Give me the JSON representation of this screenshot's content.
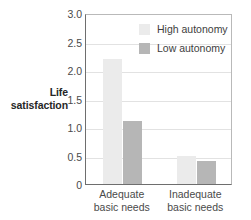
{
  "chart_data": {
    "type": "bar",
    "title": "",
    "xlabel": "",
    "ylabel": "Life satisfaction",
    "categories": [
      "Adequate basic needs",
      "Inadequate basic needs"
    ],
    "series": [
      {
        "name": "High autonomy",
        "color": "#ebebeb",
        "values": [
          2.2,
          0.5
        ]
      },
      {
        "name": "Low autonomy",
        "color": "#b6b6b6",
        "values": [
          1.1,
          0.4
        ]
      }
    ],
    "ylim": [
      0,
      3.0
    ],
    "yticks": [
      0,
      0.5,
      1.0,
      1.5,
      2.0,
      2.5,
      3.0
    ],
    "ytick_labels": [
      "0",
      "0.5",
      "1.0",
      "1.5",
      "2.0",
      "2.5",
      "3.0"
    ],
    "grid": true,
    "legend_position": "top-right"
  },
  "axis": {
    "y_title_lines": [
      "Life",
      "satisfaction"
    ],
    "tick_labels": {
      "y": [
        "3.0",
        "2.5",
        "2.0",
        "1.5",
        "1.0",
        "0.5",
        "0"
      ],
      "x": [
        {
          "line1": "Adequate",
          "line2": "basic needs"
        },
        {
          "line1": "Inadequate",
          "line2": "basic needs"
        }
      ]
    }
  },
  "legend": {
    "items": [
      {
        "label": "High autonomy",
        "color": "#ebebeb"
      },
      {
        "label": "Low autonomy",
        "color": "#b6b6b6"
      }
    ]
  },
  "colors": {
    "high_autonomy": "#ebebeb",
    "low_autonomy": "#b6b6b6",
    "axis": "#6e6e6e",
    "grid": "#e2e2e2",
    "background": "#ffffff",
    "text": "#4a4a4a"
  }
}
